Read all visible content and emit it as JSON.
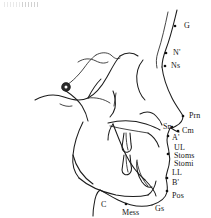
{
  "figure": {
    "background_color": "#ffffff",
    "line_color": "#1c1c1c",
    "label_color": "#141414",
    "width": 211,
    "height": 218
  },
  "landmarks": [
    {
      "id": "G",
      "label": "G",
      "label_x": 184,
      "label_y": 22,
      "dot_x": 175,
      "dot_y": 26,
      "has_dot": true
    },
    {
      "id": "Nprime",
      "label": "N'",
      "label_x": 173,
      "label_y": 49,
      "dot_x": 166,
      "dot_y": 53,
      "has_dot": true
    },
    {
      "id": "Ns",
      "label": "Ns",
      "label_x": 171,
      "label_y": 62,
      "dot_x": 165,
      "dot_y": 66,
      "has_dot": true
    },
    {
      "id": "Prn",
      "label": "Prn",
      "label_x": 189,
      "label_y": 112,
      "dot_x": 183,
      "dot_y": 116,
      "has_dot": true
    },
    {
      "id": "Sn",
      "label": "Sn",
      "label_x": 163,
      "label_y": 123,
      "dot_x": 172,
      "dot_y": 127,
      "has_dot": true
    },
    {
      "id": "Cm",
      "label": "Cm",
      "label_x": 182,
      "label_y": 127,
      "dot_x": 178,
      "dot_y": 131,
      "has_dot": true
    },
    {
      "id": "Aprime",
      "label": "A'",
      "label_x": 172,
      "label_y": 134,
      "dot_x": 168,
      "dot_y": 136,
      "has_dot": true
    },
    {
      "id": "UL",
      "label": "UL",
      "label_x": 174,
      "label_y": 144,
      "dot_x": 170,
      "dot_y": 146,
      "has_dot": false
    },
    {
      "id": "Stoms",
      "label": "Stoms",
      "label_x": 174,
      "label_y": 152,
      "dot_x": 168,
      "dot_y": 154,
      "has_dot": true
    },
    {
      "id": "Stomi",
      "label": "Stomi",
      "label_x": 174,
      "label_y": 160,
      "dot_x": 168,
      "dot_y": 158,
      "has_dot": false
    },
    {
      "id": "LL",
      "label": "LL",
      "label_x": 172,
      "label_y": 169,
      "dot_x": 168,
      "dot_y": 167,
      "has_dot": false
    },
    {
      "id": "Bprime",
      "label": "B'",
      "label_x": 172,
      "label_y": 179,
      "dot_x": 167,
      "dot_y": 178,
      "has_dot": true
    },
    {
      "id": "Pos",
      "label": "Pos",
      "label_x": 172,
      "label_y": 192,
      "dot_x": 167,
      "dot_y": 191,
      "has_dot": true
    },
    {
      "id": "Gs",
      "label": "Gs",
      "label_x": 155,
      "label_y": 205,
      "dot_x": 150,
      "dot_y": 205,
      "has_dot": false
    },
    {
      "id": "Mess",
      "label": "Mess",
      "label_x": 122,
      "label_y": 209,
      "dot_x": 126,
      "dot_y": 204,
      "has_dot": true
    },
    {
      "id": "C",
      "label": "C",
      "label_x": 101,
      "label_y": 201,
      "dot_x": 0,
      "dot_y": 0,
      "has_dot": false
    }
  ],
  "markers": {
    "sella": {
      "name": "sella-turcica-marker",
      "x": 66,
      "y": 87,
      "r_outer": 4.2,
      "r_inner": 1.5
    }
  },
  "paths": {
    "forehead_profile": "M 177 10 C 174 22, 171 36, 166 49 C 163 57, 162 62, 162 67",
    "nose_bridge_upper": "M 168 12 C 165 26, 162 40, 158 52 C 156 58, 156 63, 157 68",
    "nose_dorsum": "M 162 67 C 163 76, 167 88, 172 98 C 176 106, 181 112, 183 116",
    "nose_tip_to_sn": "M 183 116 C 183 120, 180 124, 176 126 C 173 128, 172 128, 171 128",
    "columella_base": "M 171 128 C 174 130, 177 132, 179 132",
    "upper_lip_profile": "M 170 128 C 168 132, 167 136, 167 140 C 167 145, 169 149, 169 153",
    "lower_lip_profile": "M 169 153 C 170 157, 170 161, 169 165 C 168 170, 166 174, 166 178",
    "chin_profile": "M 166 178 C 167 183, 168 188, 167 192 C 166 197, 161 202, 152 205",
    "submental_line": "M 152 205 C 141 208, 128 205, 118 200 C 110 196, 104 192, 100 190",
    "neck_line": "M 100 190 C 97 192, 95 197, 94 205 C 93 210, 93 214, 93 216",
    "cranium_outer": "M 35 100 C 46 94, 56 94, 64 97 C 72 100, 80 102, 88 98 C 96 94, 102 86, 107 77 C 112 68, 116 60, 120 56",
    "cranial_base": "M 62 88 C 70 84, 78 76, 84 68 C 89 61, 93 57, 96 55",
    "sella_floor": "M 78 62 C 84 58, 90 58, 96 61 C 100 63, 104 64, 108 62",
    "sphenoid_wing": "M 96 55 C 101 52, 107 52, 111 55 C 114 58, 117 60, 120 58",
    "clivus": "M 66 91 C 72 95, 78 100, 82 106 C 85 111, 87 116, 88 121",
    "orbital_floor": "M 88 98 C 96 97, 104 99, 110 103",
    "pterygoid": "M 113 91 C 115 96, 116 102, 115 108 C 114 112, 112 115, 110 117",
    "orbit_arc": "M 143 60 C 138 66, 136 74, 137 82 C 138 90, 141 96, 145 100",
    "maxilla_upper": "M 108 123 C 120 120, 134 120, 146 124 C 152 126, 157 128, 160 130",
    "maxilla_palate": "M 110 126 C 122 129, 136 131, 148 133",
    "maxilla_anterior": "M 148 133 C 153 136, 157 141, 159 147",
    "zygomatic_arch": "M 140 114 C 146 111, 152 112, 156 116 C 159 119, 161 122, 162 125",
    "mandible_ramus_post": "M 83 122 C 78 132, 74 144, 73 155 C 72 164, 74 172, 79 178",
    "mandible_body_lower": "M 79 178 C 88 186, 102 192, 116 195 C 128 197, 139 197, 148 195",
    "mandible_ramus_ant": "M 113 124 C 117 134, 121 145, 126 155 C 131 165, 138 174, 145 180",
    "mandible_symphysis": "M 145 180 C 151 186, 155 191, 156 196",
    "mandible_notch": "M 148 195 C 152 192, 155 187, 156 181",
    "condyle_neck": "M 113 124 C 110 128, 108 134, 108 140",
    "gonial_curve": "M 73 155 C 76 167, 83 177, 93 184",
    "upper_incisor_outline": "M 124 133 L 122 147 C 122 151, 125 153, 128 152 C 131 151, 132 148, 131 144 L 130 133",
    "upper_incisor_root": "M 126 133 C 126 140, 127 146, 128 150",
    "lower_incisor_outline": "M 124 155 L 122 170 C 122 174, 126 176, 129 174 C 132 172, 132 169, 131 165 L 130 155",
    "lower_incisor_root": "M 126 155 C 126 162, 127 168, 128 172",
    "lower_anterior_tooth": "M 137 160 C 136 168, 138 176, 142 182 C 145 186, 149 188, 152 187",
    "symphysis_inner": "M 137 162 C 139 172, 143 181, 148 186",
    "nasal_floor_short": "M 116 93 L 114 106",
    "soft_tissue_upper_face": "M 120 56 C 126 52, 133 52, 138 56",
    "ear_canal_hint": "M 60 104 C 64 106, 68 107, 72 106",
    "upper_profile_crest": "M 88 98 C 92 90, 96 84, 101 79"
  }
}
